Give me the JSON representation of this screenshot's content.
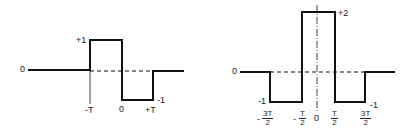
{
  "figures": [
    {
      "name": "doublet-pulse",
      "labels": {
        "baseline": "0",
        "top": "+1",
        "bottom": "-1",
        "x_minus_T": "-T",
        "x_zero": "0",
        "x_plus_T": "+T"
      }
    },
    {
      "name": "three-step-pulse",
      "labels": {
        "baseline": "0",
        "top": "+2",
        "bottom_left": "-1",
        "bottom_right": "-1",
        "x_zero": "0",
        "ticks": [
          {
            "sign": "-",
            "num": "3T",
            "den": "2"
          },
          {
            "sign": "-",
            "num": "T",
            "den": "2"
          },
          {
            "sign": "",
            "num": "T",
            "den": "2"
          },
          {
            "sign": "",
            "num": "3T",
            "den": "2"
          }
        ]
      }
    }
  ]
}
